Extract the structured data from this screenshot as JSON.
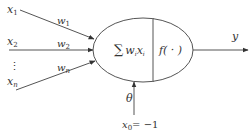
{
  "diagram": {
    "inputs": [
      {
        "label": "x",
        "sub": "1",
        "weight": "w",
        "weight_sub": "1"
      },
      {
        "label": "x",
        "sub": "2",
        "weight": "w",
        "weight_sub": "2"
      },
      {
        "label": "x",
        "sub": "n",
        "weight": "w",
        "weight_sub": "n"
      }
    ],
    "ellipsis": "⋮",
    "summation": {
      "symbol": "∑",
      "term": "w",
      "term_sub": "i",
      "var": "x",
      "var_sub": "i"
    },
    "activation": "f( · )",
    "output": "y",
    "bias": {
      "weight": "θ",
      "input": "x",
      "input_sub": "0",
      "input_value": "= −1"
    },
    "colors": {
      "stroke": "#555555",
      "text": "#333333",
      "background": "#ffffff"
    }
  }
}
